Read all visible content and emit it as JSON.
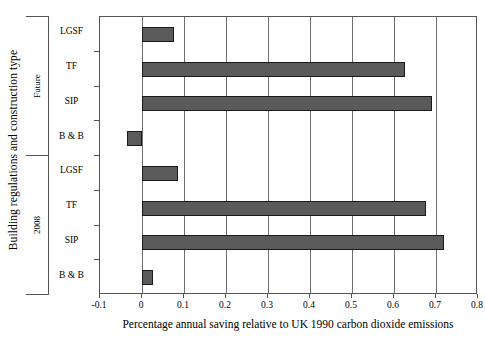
{
  "chart_data": {
    "type": "bar",
    "orientation": "horizontal",
    "title": "",
    "xlabel": "Percentage annual saving relative to UK 1990 carbon dioxide emissions",
    "ylabel": "Building regulations and construction type",
    "xlim": [
      -0.1,
      0.8
    ],
    "xticks": [
      "-0.1",
      "0",
      "0.1",
      "0.2",
      "0.3",
      "0.4",
      "0.5",
      "0.6",
      "0.7",
      "0.8"
    ],
    "xtick_values": [
      -0.1,
      0,
      0.1,
      0.2,
      0.3,
      0.4,
      0.5,
      0.6,
      0.7,
      0.8
    ],
    "grid": "vertical",
    "legend": "none",
    "bar_color": "#5a5a5a",
    "bar_edge_color": "#1a1a1a",
    "groups": [
      {
        "name": "Future",
        "categories": [
          "LGSF",
          "TF",
          "SIP",
          "B & B"
        ],
        "values": [
          0.075,
          0.625,
          0.69,
          -0.035
        ]
      },
      {
        "name": "2008",
        "categories": [
          "LGSF",
          "TF",
          "SIP",
          "B & B"
        ],
        "values": [
          0.085,
          0.675,
          0.72,
          0.027
        ]
      }
    ],
    "bars": [
      {
        "group": "Future",
        "category": "LGSF",
        "value": 0.075
      },
      {
        "group": "Future",
        "category": "TF",
        "value": 0.625
      },
      {
        "group": "Future",
        "category": "SIP",
        "value": 0.69
      },
      {
        "group": "Future",
        "category": "B & B",
        "value": -0.035
      },
      {
        "group": "2008",
        "category": "LGSF",
        "value": 0.085
      },
      {
        "group": "2008",
        "category": "TF",
        "value": 0.675
      },
      {
        "group": "2008",
        "category": "SIP",
        "value": 0.72
      },
      {
        "group": "2008",
        "category": "B & B",
        "value": 0.027
      }
    ]
  }
}
